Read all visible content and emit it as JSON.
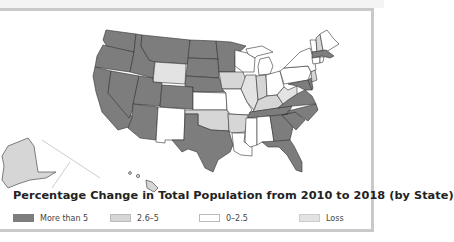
{
  "title": "Percentage Change in Total Population from 2010 to 2018 (by State)",
  "colors": {
    "more_than_5": "#7d7d7d",
    "2.6_5": "#d6d6d6",
    "0_2.5": "#ffffff",
    "loss": "#e3e3e3",
    "border": "#333333",
    "frame": "#c9c9c9"
  },
  "legend": [
    {
      "label": "More than 5",
      "color": "#7d7d7d"
    },
    {
      "label": "2.6–5",
      "color": "#d6d6d6"
    },
    {
      "label": "0–2.5",
      "color": "#ffffff"
    },
    {
      "label": "Loss",
      "color": "#e3e3e3"
    }
  ],
  "states": {
    "WA": "More than 5",
    "OR": "More than 5",
    "CA": "More than 5",
    "NV": "More than 5",
    "ID": "More than 5",
    "MT": "More than 5",
    "WY": "2.6–5",
    "UT": "More than 5",
    "AZ": "More than 5",
    "CO": "More than 5",
    "NM": "0–2.5",
    "ND": "More than 5",
    "SD": "More than 5",
    "NE": "More than 5",
    "KS": "0–2.5",
    "OK": "2.6–5",
    "TX": "More than 5",
    "MN": "More than 5",
    "IA": "2.6–5",
    "MO": "0–2.5",
    "AR": "2.6–5",
    "LA": "0–2.5",
    "WI": "0–2.5",
    "IL": "Loss",
    "MI": "0–2.5",
    "IN": "2.6–5",
    "OH": "0–2.5",
    "KY": "2.6–5",
    "TN": "More than 5",
    "MS": "0–2.5",
    "AL": "0–2.5",
    "GA": "More than 5",
    "FL": "More than 5",
    "SC": "More than 5",
    "NC": "More than 5",
    "VA": "More than 5",
    "WV": "Loss",
    "PA": "0–2.5",
    "NY": "0–2.5",
    "VT": "0–2.5",
    "NH": "2.6–5",
    "ME": "0–2.5",
    "MA": "More than 5",
    "CT": "0–2.5",
    "RI": "0–2.5",
    "NJ": "2.6–5",
    "DE": "More than 5",
    "MD": "More than 5",
    "AK": "2.6–5",
    "HI": "2.6–5"
  }
}
